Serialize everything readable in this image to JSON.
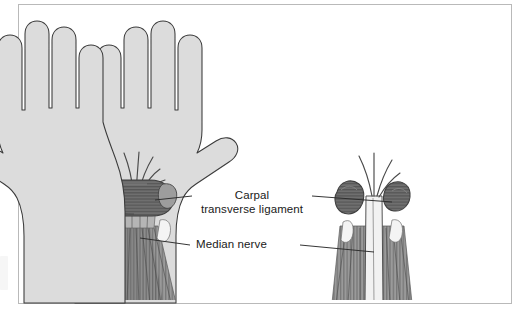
{
  "figure": {
    "kind": "medical-illustration",
    "panels": [
      {
        "id": "left-hand",
        "side": "left",
        "state": "Transverse carpal ligament intact",
        "description": "Palmar view of hand with intact transverse carpal ligament compressing the median nerve"
      },
      {
        "id": "right-hand",
        "side": "right",
        "state": "Transverse carpal ligament divided",
        "description": "Palmar view of hand after release; ligament split into two retracted halves with median nerve decompressed"
      }
    ]
  },
  "labels": {
    "ligament": {
      "line1": "Carpal",
      "line2": "transverse ligament"
    },
    "nerve": {
      "text": "Median nerve"
    }
  },
  "colors": {
    "skin_fill": "#dcdcdc",
    "skin_outline": "#3a3a3a",
    "ligament_dark": "#6f6f6f",
    "ligament_shade": "#595959",
    "tendon_mid": "#9a9a9a",
    "tendon_shade": "#7c7c7c",
    "nerve_pale": "#f2f2f2",
    "leader_line": "#2b2b2b",
    "frame_border": "#b9b9b9",
    "page_background": "#ffffff",
    "text": "#1a1a1a"
  }
}
